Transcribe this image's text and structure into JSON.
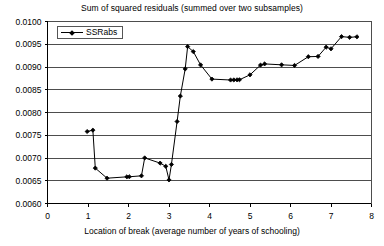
{
  "chart_data": {
    "type": "line",
    "title": "Sum of squared residuals (summed over two subsamples)",
    "xlabel": "Location of break (average number of years of schooling)",
    "ylabel": "",
    "xlim": [
      0,
      8
    ],
    "ylim": [
      0.006,
      0.01
    ],
    "xticks": [
      "0",
      "1",
      "2",
      "3",
      "4",
      "5",
      "6",
      "7",
      "8"
    ],
    "xtick_values": [
      0,
      1,
      2,
      3,
      4,
      5,
      6,
      7,
      8
    ],
    "yticks": [
      "0.0060",
      "0.0065",
      "0.0070",
      "0.0075",
      "0.0080",
      "0.0085",
      "0.0090",
      "0.0095",
      "0.0100"
    ],
    "ytick_values": [
      0.006,
      0.0065,
      0.007,
      0.0075,
      0.008,
      0.0085,
      0.009,
      0.0095,
      0.01
    ],
    "grid": "horizontal",
    "legend_position": "top-left-inside",
    "marker": "diamond",
    "line_color": "#000000",
    "marker_color": "#000000",
    "series": [
      {
        "name": "SSRabs",
        "points": [
          [
            0.98,
            0.007582
          ],
          [
            1.12,
            0.007612
          ],
          [
            1.18,
            0.006778
          ],
          [
            1.47,
            0.006556
          ],
          [
            1.96,
            0.006586
          ],
          [
            2.02,
            0.006588
          ],
          [
            2.32,
            0.006608
          ],
          [
            2.4,
            0.007002
          ],
          [
            2.78,
            0.006888
          ],
          [
            2.92,
            0.006818
          ],
          [
            3.0,
            0.006518
          ],
          [
            3.06,
            0.006858
          ],
          [
            3.2,
            0.007802
          ],
          [
            3.28,
            0.008362
          ],
          [
            3.4,
            0.008958
          ],
          [
            3.46,
            0.009448
          ],
          [
            3.6,
            0.009338
          ],
          [
            3.78,
            0.009046
          ],
          [
            4.06,
            0.008734
          ],
          [
            4.52,
            0.008714
          ],
          [
            4.6,
            0.008716
          ],
          [
            4.68,
            0.008718
          ],
          [
            4.74,
            0.00872
          ],
          [
            5.0,
            0.008828
          ],
          [
            5.26,
            0.009042
          ],
          [
            5.36,
            0.009068
          ],
          [
            5.78,
            0.009048
          ],
          [
            6.1,
            0.009034
          ],
          [
            6.44,
            0.009226
          ],
          [
            6.68,
            0.009232
          ],
          [
            6.88,
            0.009436
          ],
          [
            7.0,
            0.0094
          ],
          [
            7.26,
            0.009668
          ],
          [
            7.46,
            0.009652
          ],
          [
            7.64,
            0.009664
          ]
        ]
      }
    ]
  },
  "legend": {
    "label": "SSRabs"
  }
}
